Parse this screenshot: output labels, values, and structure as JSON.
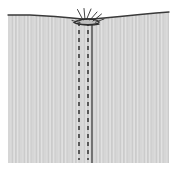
{
  "figure": {
    "canvas": {
      "width": 177,
      "height": 172
    },
    "background_color": "#ffffff",
    "tissue": {
      "label": "tissue-body",
      "fill_color": "#d6d6d6",
      "texture_color": "#c8c8c8",
      "texture_highlight_color": "#e2e2e2",
      "left_edge_x": 8,
      "right_edge_x": 169,
      "bottom_edge_y": 163,
      "surface_outline_color": "#3a3a3a",
      "surface_path": "M 8 15 L 30 15 L 55 16.5 L 72 18 L 82 19 L 92 19 L 104 18 L 120 16.5 L 140 14.5 L 156 13 L 169 12"
    },
    "wound_line": {
      "label": "incision-line",
      "color": "#4a4a4a",
      "x": 92,
      "top_y": 20,
      "bottom_y": 163,
      "width": 1.4
    },
    "stitch_lines": [
      {
        "label": "left-suture-dashed-line",
        "color": "#3c3c3c",
        "x": 79,
        "top_y": 22,
        "bottom_y": 160,
        "dash": "4 4",
        "width": 1.6
      },
      {
        "label": "right-suture-dashed-line",
        "color": "#3c3c3c",
        "x": 88,
        "top_y": 22,
        "bottom_y": 160,
        "dash": "4 4",
        "width": 1.6
      }
    ],
    "knot": {
      "label": "surgical-knot",
      "color": "#2e2e2e",
      "center_x": 88,
      "center_y": 21,
      "loop_paths": [
        "M 74 22.5 C 78 19.5, 86 18.5, 93 19.5 C 99 20.3, 101 22.5, 97 23.6 C 92 24.9, 82 24.6, 76 23.4 Z",
        "M 79 20.8 C 83 18.8, 91 18.4, 95 19.8",
        "M 77 23.8 C 83 25.6, 93 25.6, 99 24.2"
      ],
      "tail_paths": [
        "M 83 20 L 77.5 9.5",
        "M 85 19.5 L 84 8.5",
        "M 86.5 19.5 L 91 9.0",
        "M 90 20 L 97 12.0",
        "M 93 21 L 101.5 14.0",
        "M 95.5 22.2 L 104 19.0",
        "M 80 22.5 L 72 20.5"
      ],
      "tail_width": 0.9
    }
  }
}
